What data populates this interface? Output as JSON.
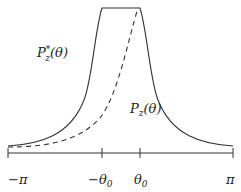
{
  "diagram": {
    "type": "function-plot",
    "curves": [
      {
        "name": "P_z_star",
        "label": "P*z(θ)",
        "style": "solid",
        "description": "symmetric peaked curve with flat plateau between -θ0 and θ0"
      },
      {
        "name": "P_z",
        "label": "Pz(θ)",
        "style": "dashed",
        "description": "asymmetric curve rising to plateau end at θ0"
      }
    ],
    "labels": {
      "p_star": {
        "main": "P",
        "sup": "*",
        "sub": "z",
        "arg": "(θ)"
      },
      "p": {
        "main": "P",
        "sub": "z",
        "arg": "(θ)"
      }
    },
    "axis": {
      "ticks": [
        {
          "label": "−π",
          "position": "-pi"
        },
        {
          "label": "−θ0",
          "main": "−θ",
          "sub": "0",
          "position": "-theta0"
        },
        {
          "label": "θ0",
          "main": "θ",
          "sub": "0",
          "position": "theta0"
        },
        {
          "label": "π",
          "position": "pi"
        }
      ]
    },
    "colors": {
      "line": "#333333",
      "background": "#ffffff"
    }
  }
}
